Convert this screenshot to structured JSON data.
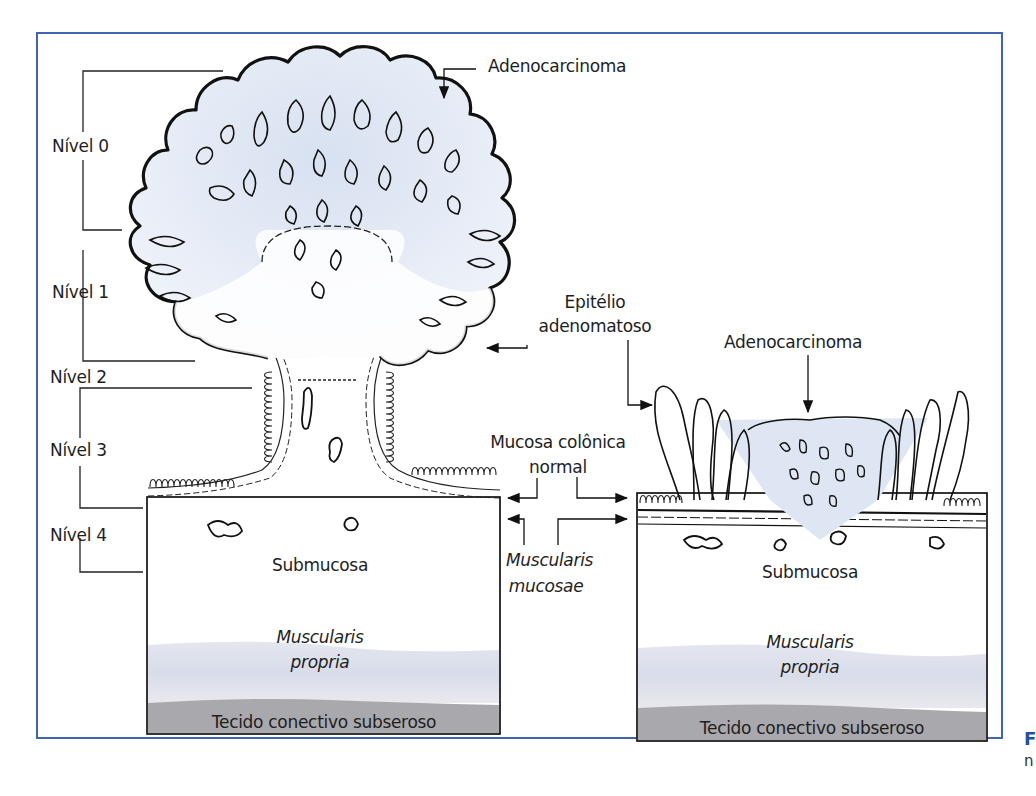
{
  "figure": {
    "frame_color": "#3f63b5",
    "caption_fragment_1": "F",
    "caption_fragment_2": "n"
  },
  "levels": {
    "title": "Haggitt levels (left polyp)",
    "items": [
      {
        "label": "Nível 0"
      },
      {
        "label": "Nível 1"
      },
      {
        "label": "Nível 2"
      },
      {
        "label": "Nível 3"
      },
      {
        "label": "Nível 4"
      }
    ]
  },
  "left_diagram": {
    "type": "pedunculated polyp",
    "top_label": "Adenocarcinoma",
    "epithelium_label_1": "Epitélio",
    "epithelium_label_2": "adenomatoso",
    "submucosa_label": "Submucosa",
    "muscularis_label_1": "Muscularis",
    "muscularis_label_2": "propria",
    "subserosa_label": "Tecido conectivo subseroso"
  },
  "center_labels": {
    "mucosa_1": "Mucosa colônica",
    "mucosa_2": "normal",
    "mm_1": "Muscularis",
    "mm_2": "mucosae"
  },
  "right_diagram": {
    "type": "sessile polyp",
    "top_label": "Adenocarcinoma",
    "submucosa_label": "Submucosa",
    "muscularis_label_1": "Muscularis",
    "muscularis_label_2": "propria",
    "subserosa_label": "Tecido conectivo subseroso"
  },
  "colors": {
    "tumor_tint": "#dfe6f3",
    "muscularis_band": "#d9dbe6",
    "subserosa_band": "#a9a9ad",
    "ink": "#111111"
  }
}
